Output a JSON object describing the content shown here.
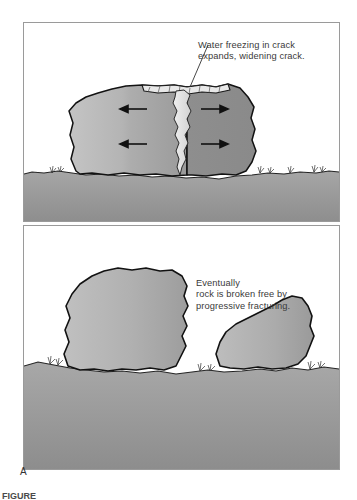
{
  "figure": {
    "panel_letter": "A",
    "caption_partial": "FIGURE",
    "panels": [
      {
        "id": "top",
        "name": "water-freezing-panel",
        "caption_lines": "Water freezing in crack\nexpands, widening crack.",
        "has_leader_line": true,
        "elements": {
          "rock_label": "cracked boulder",
          "crack_label": "ice-filled crack",
          "arrow_count": 4,
          "arrow_direction": "outward",
          "ground_label": "ground surface"
        }
      },
      {
        "id": "bottom",
        "name": "broken-rock-panel",
        "caption_lines": "Eventually\nrock is broken free by\nprogressive fracturing.",
        "has_leader_line": false,
        "elements": {
          "rock_left_label": "large remaining rock",
          "rock_right_label": "broken free boulder",
          "ground_label": "ground surface"
        }
      }
    ]
  },
  "colors": {
    "frame_border": "#9a9a9a",
    "rock_light": "#b9b9b9",
    "rock_dark": "#8f8f8f",
    "ground": "#9c9c9c",
    "crack_ice": "#e2e2e2",
    "outline": "#1a1a1a",
    "text": "#3a3a3a",
    "background": "#ffffff"
  }
}
